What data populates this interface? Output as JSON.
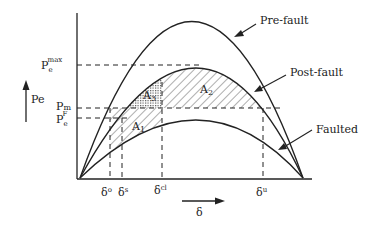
{
  "diagram": {
    "title": "",
    "y_axis_label": "Pe",
    "x_axis_label": "δ",
    "y_levels": [
      {
        "id": "pemax",
        "base": "P",
        "sub": "e",
        "sup": "max"
      },
      {
        "id": "pm",
        "base": "P",
        "sub": "m",
        "sup": ""
      },
      {
        "id": "pef",
        "base": "P",
        "sub": "e",
        "sup": "F"
      }
    ],
    "x_marks": [
      {
        "id": "delta_o",
        "base": "δ",
        "sup": "o"
      },
      {
        "id": "delta_s",
        "base": "δ",
        "sup": "s"
      },
      {
        "id": "delta_cl",
        "base": "δ",
        "sup": "cl"
      },
      {
        "id": "delta_u",
        "base": "δ",
        "sup": "u"
      }
    ],
    "curves": [
      {
        "id": "pre_fault",
        "label": "Pre-fault"
      },
      {
        "id": "post_fault",
        "label": "Post-fault"
      },
      {
        "id": "faulted",
        "label": "Faulted"
      }
    ],
    "areas": [
      {
        "id": "A1",
        "base": "A",
        "sub": "1"
      },
      {
        "id": "A2",
        "base": "A",
        "sub": "2"
      },
      {
        "id": "A3",
        "base": "A",
        "sub": "3"
      }
    ]
  }
}
